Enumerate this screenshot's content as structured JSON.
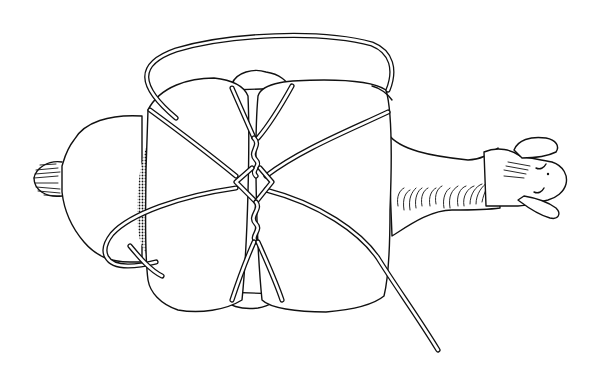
{
  "illustration": {
    "subject": "Top-down view of a pack animal carrying a load secured with a diamond hitch",
    "colors": {
      "ink": "#111111",
      "background": "#ffffff"
    },
    "parts": {
      "tail": "tail",
      "rump": "rump",
      "load_left": "left pack",
      "load_right": "right pack",
      "top_load": "top load",
      "neck": "neck with mane",
      "head": "head with ears",
      "rope": "lash rope",
      "diamond": "diamond hitch",
      "rope_end": "loose rope end"
    }
  }
}
